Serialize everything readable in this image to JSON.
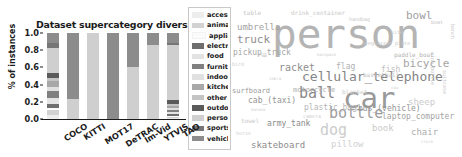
{
  "figure": {
    "panels": [
      "bar-chart",
      "word-cloud"
    ]
  },
  "chart_data": {
    "type": "bar",
    "subtype": "stacked-percentage",
    "title": "Dataset supercategory diversity",
    "xlabel": "",
    "ylabel": "% of instances",
    "ylim": [
      0.0,
      1.0
    ],
    "yticks": [
      "0.0",
      "0.2",
      "0.4",
      "0.6",
      "0.8",
      "1.0"
    ],
    "ytick_values": [
      0.0,
      0.2,
      0.4,
      0.6,
      0.8,
      1.0
    ],
    "grid": false,
    "legend_position": "right",
    "categories": [
      "COCO",
      "KITTI",
      "MOT17",
      "DeTRAC",
      "Im-Vid",
      "YTVIS",
      "TAO"
    ],
    "legend": [
      {
        "label": "accessory",
        "color": "#ededed"
      },
      {
        "label": "animal",
        "color": "#d2d2d2"
      },
      {
        "label": "appliance",
        "color": "#fbfbfb"
      },
      {
        "label": "electronic",
        "color": "#6e6e6e"
      },
      {
        "label": "food",
        "color": "#e3e3e3"
      },
      {
        "label": "furniture",
        "color": "#808080"
      },
      {
        "label": "indoor",
        "color": "#e0e0e0"
      },
      {
        "label": "kitchen",
        "color": "#a8a8a8"
      },
      {
        "label": "other",
        "color": "#c4c4c4"
      },
      {
        "label": "outdoor",
        "color": "#5a5a5a"
      },
      {
        "label": "person",
        "color": "#cfcfcf"
      },
      {
        "label": "sports",
        "color": "#767676"
      },
      {
        "label": "vehicle",
        "color": "#8c8c8c"
      }
    ],
    "series": [
      {
        "name": "accessory",
        "color": "#ededed",
        "values": [
          0.05,
          0.0,
          0.0,
          0.0,
          0.0,
          0.0,
          0.01
        ]
      },
      {
        "name": "animal",
        "color": "#d2d2d2",
        "values": [
          0.06,
          0.0,
          0.0,
          0.0,
          0.0,
          0.0,
          0.02
        ]
      },
      {
        "name": "appliance",
        "color": "#fbfbfb",
        "values": [
          0.02,
          0.0,
          0.0,
          0.0,
          0.0,
          0.0,
          0.01
        ]
      },
      {
        "name": "electronic",
        "color": "#6e6e6e",
        "values": [
          0.05,
          0.0,
          0.0,
          0.0,
          0.0,
          0.0,
          0.02
        ]
      },
      {
        "name": "food",
        "color": "#e3e3e3",
        "values": [
          0.07,
          0.0,
          0.0,
          0.0,
          0.0,
          0.0,
          0.02
        ]
      },
      {
        "name": "furniture",
        "color": "#808080",
        "values": [
          0.08,
          0.0,
          0.0,
          0.0,
          0.0,
          0.0,
          0.03
        ]
      },
      {
        "name": "indoor",
        "color": "#e0e0e0",
        "values": [
          0.04,
          0.0,
          0.0,
          0.0,
          0.0,
          0.0,
          0.02
        ]
      },
      {
        "name": "kitchen",
        "color": "#a8a8a8",
        "values": [
          0.07,
          0.0,
          0.0,
          0.0,
          0.0,
          0.0,
          0.02
        ]
      },
      {
        "name": "other",
        "color": "#c4c4c4",
        "values": [
          0.04,
          0.0,
          0.0,
          0.0,
          0.0,
          0.0,
          0.02
        ]
      },
      {
        "name": "outdoor",
        "color": "#5a5a5a",
        "values": [
          0.06,
          0.0,
          0.0,
          0.0,
          0.0,
          0.0,
          0.05
        ]
      },
      {
        "name": "person",
        "color": "#cfcfcf",
        "values": [
          0.29,
          0.23,
          1.0,
          0.0,
          0.61,
          0.86,
          0.64
        ]
      },
      {
        "name": "sports",
        "color": "#767676",
        "values": [
          0.05,
          0.0,
          0.0,
          0.0,
          0.0,
          0.0,
          0.02
        ]
      },
      {
        "name": "vehicle",
        "color": "#8c8c8c",
        "values": [
          0.12,
          0.77,
          0.0,
          1.0,
          0.39,
          0.14,
          0.12
        ]
      }
    ]
  },
  "word_cloud": {
    "type": "word-cloud",
    "words": [
      {
        "text": "person",
        "size": 41,
        "x": 41,
        "y": 14,
        "color": "#b4b4b4",
        "rotate": 0
      },
      {
        "text": "car",
        "size": 29,
        "x": 112,
        "y": 84,
        "color": "#999999",
        "rotate": 0
      },
      {
        "text": "cellular_telephone",
        "size": 13,
        "x": 71,
        "y": 70,
        "color": "#858585",
        "rotate": 0
      },
      {
        "text": "bottle",
        "size": 15,
        "x": 98,
        "y": 106,
        "color": "#9d9d9d",
        "rotate": 0
      },
      {
        "text": "ball",
        "size": 15,
        "x": 68,
        "y": 86,
        "color": "#8a8a8a",
        "rotate": 0
      },
      {
        "text": "dog",
        "size": 15,
        "x": 89,
        "y": 123,
        "color": "#cccccc",
        "rotate": 0
      },
      {
        "text": "truck",
        "size": 11,
        "x": 6,
        "y": 34,
        "color": "#8e8e8e",
        "rotate": 0
      },
      {
        "text": "umbrella",
        "size": 9,
        "x": 6,
        "y": 23,
        "color": "#a2a2a2",
        "rotate": 0
      },
      {
        "text": "bicycle",
        "size": 11,
        "x": 172,
        "y": 58,
        "color": "#a5a5a5",
        "rotate": 0
      },
      {
        "text": "bowl",
        "size": 11,
        "x": 175,
        "y": 10,
        "color": "#a0a0a0",
        "rotate": 0
      },
      {
        "text": "racket",
        "size": 10,
        "x": 48,
        "y": 63,
        "color": "#8f8f8f",
        "rotate": 0
      },
      {
        "text": "pickup_truck",
        "size": 8,
        "x": 2,
        "y": 49,
        "color": "#a7a7a7",
        "rotate": 0
      },
      {
        "text": "skateboard",
        "size": 9,
        "x": 20,
        "y": 141,
        "color": "#8d8d8d",
        "rotate": 0
      },
      {
        "text": "bus_(vehicle)",
        "size": 8,
        "x": 127,
        "y": 105,
        "color": "#949494",
        "rotate": 0
      },
      {
        "text": "laptop_computer",
        "size": 8,
        "x": 151,
        "y": 113,
        "color": "#a3a3a3",
        "rotate": 0
      },
      {
        "text": "chair",
        "size": 9,
        "x": 180,
        "y": 128,
        "color": "#adadad",
        "rotate": 0
      },
      {
        "text": "cab_(taxi)",
        "size": 8,
        "x": 17,
        "y": 97,
        "color": "#949494",
        "rotate": 0
      },
      {
        "text": "army_tank",
        "size": 8,
        "x": 36,
        "y": 120,
        "color": "#8b8b8b",
        "rotate": 0
      },
      {
        "text": "plastic_bag",
        "size": 8,
        "x": 73,
        "y": 104,
        "color": "#b5b5b5",
        "rotate": 0
      },
      {
        "text": "surfboard",
        "size": 7,
        "x": 1,
        "y": 88,
        "color": "#9b9b9b",
        "rotate": 0
      },
      {
        "text": "motorcycle",
        "size": 7,
        "x": 62,
        "y": 87,
        "color": "#aeaeae",
        "rotate": 0
      },
      {
        "text": "flag",
        "size": 8,
        "x": 105,
        "y": 63,
        "color": "#b0b0b0",
        "rotate": 0
      },
      {
        "text": "fish",
        "size": 8,
        "x": 150,
        "y": 66,
        "color": "#c0c0c0",
        "rotate": 0
      },
      {
        "text": "sheep",
        "size": 9,
        "x": 177,
        "y": 98,
        "color": "#cbcbcb",
        "rotate": 0
      },
      {
        "text": "basketball",
        "size": 6,
        "x": 132,
        "y": 72,
        "color": "#c2c2c2",
        "rotate": 0
      },
      {
        "text": "paddle_boat",
        "size": 6,
        "x": 163,
        "y": 52,
        "color": "#b3b3b3",
        "rotate": 0
      },
      {
        "text": "eyeglasses_plate",
        "size": 5,
        "x": 131,
        "y": 41,
        "color": "#c6c6c6",
        "rotate": 0
      },
      {
        "text": "book",
        "size": 9,
        "x": 141,
        "y": 124,
        "color": "#cacaca",
        "rotate": 0
      },
      {
        "text": "pillow",
        "size": 9,
        "x": 100,
        "y": 140,
        "color": "#d0d0d0",
        "rotate": 0
      },
      {
        "text": "blanket",
        "size": 6,
        "x": 111,
        "y": 89,
        "color": "#cdcdcd",
        "rotate": 0
      },
      {
        "text": "drink_container",
        "size": 6,
        "x": 60,
        "y": 10,
        "color": "#c8c8c8",
        "rotate": 0
      },
      {
        "text": "table",
        "size": 6,
        "x": 12,
        "y": 10,
        "color": "#c5c5c5",
        "rotate": 0
      },
      {
        "text": "towel",
        "size": 6,
        "x": 10,
        "y": 118,
        "color": "#c9c9c9",
        "rotate": 0
      },
      {
        "text": "camera",
        "size": 5,
        "x": 72,
        "y": 114,
        "color": "#cecece",
        "rotate": 0
      },
      {
        "text": "horse",
        "size": 5,
        "x": 5,
        "y": 131,
        "color": "#cfcfcf",
        "rotate": 0
      },
      {
        "text": "bird",
        "size": 5,
        "x": 1,
        "y": 62,
        "color": "#cdcdcd",
        "rotate": 0
      },
      {
        "text": "handbag",
        "size": 5,
        "x": 118,
        "y": 17,
        "color": "#c7c7c7",
        "rotate": 0
      },
      {
        "text": "boat",
        "size": 5,
        "x": 200,
        "y": 20,
        "color": "#c4c4c4",
        "rotate": 0
      },
      {
        "text": "wine_bottle",
        "size": 5,
        "x": 204,
        "y": 52,
        "color": "#c3c3c3",
        "rotate": 90
      },
      {
        "text": "suitcase",
        "size": 5,
        "x": 216,
        "y": 70,
        "color": "#c6c6c6",
        "rotate": 90
      },
      {
        "text": "bench",
        "size": 5,
        "x": 224,
        "y": 24,
        "color": "#c8c8c8",
        "rotate": 90
      },
      {
        "text": "cup",
        "size": 5,
        "x": 27,
        "y": 52,
        "color": "#c2c2c2",
        "rotate": 0
      },
      {
        "text": "kite",
        "size": 5,
        "x": 160,
        "y": 30,
        "color": "#cbcbcb",
        "rotate": 0
      },
      {
        "text": "backpack",
        "size": 4,
        "x": 86,
        "y": 53,
        "color": "#cfcfcf",
        "rotate": 0
      },
      {
        "text": "zebra",
        "size": 4,
        "x": 38,
        "y": 77,
        "color": "#d0d0d0",
        "rotate": 0
      },
      {
        "text": "clock",
        "size": 4,
        "x": 190,
        "y": 140,
        "color": "#d2d2d2",
        "rotate": 0
      },
      {
        "text": "banana",
        "size": 4,
        "x": 20,
        "y": 108,
        "color": "#d1d1d1",
        "rotate": 0
      },
      {
        "text": "cow",
        "size": 4,
        "x": 160,
        "y": 86,
        "color": "#cfcfcf",
        "rotate": 0
      }
    ]
  }
}
